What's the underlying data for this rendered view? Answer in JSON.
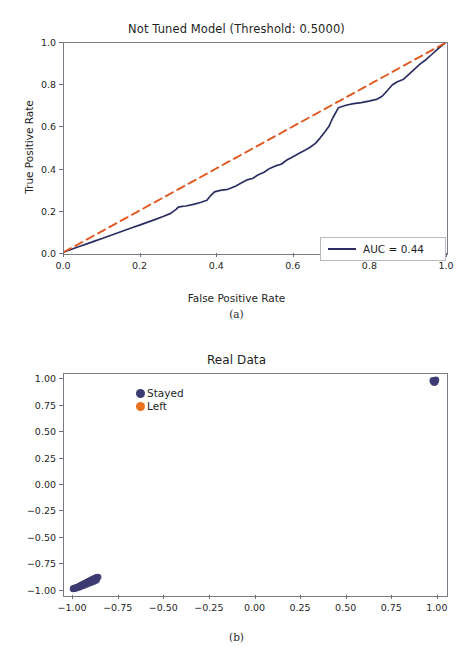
{
  "figure_a": {
    "caption": "(a)",
    "chart_data": {
      "type": "line",
      "title": "Not Tuned Model (Threshold: 0.5000)",
      "xlabel": "False Positive Rate",
      "ylabel": "True Positive Rate",
      "xlim": [
        0.0,
        1.0
      ],
      "ylim": [
        0.0,
        1.0
      ],
      "xticks": [
        "0.0",
        "0.2",
        "0.4",
        "0.6",
        "0.8",
        "1.0"
      ],
      "xtick_values": [
        0.0,
        0.2,
        0.4,
        0.6,
        0.8,
        1.0
      ],
      "yticks": [
        "0.0",
        "0.2",
        "0.4",
        "0.6",
        "0.8",
        "1.0"
      ],
      "ytick_values": [
        0.0,
        0.2,
        0.4,
        0.6,
        0.8,
        1.0
      ],
      "grid": false,
      "legend_position": "lower right",
      "series": [
        {
          "name": "AUC = 0.44",
          "color": "#2c2e63",
          "style": "solid",
          "x": [
            0.0,
            0.02,
            0.04,
            0.06,
            0.08,
            0.1,
            0.12,
            0.14,
            0.16,
            0.18,
            0.2,
            0.22,
            0.24,
            0.26,
            0.28,
            0.295,
            0.3,
            0.31,
            0.32,
            0.34,
            0.36,
            0.375,
            0.385,
            0.395,
            0.41,
            0.43,
            0.45,
            0.465,
            0.48,
            0.495,
            0.51,
            0.525,
            0.54,
            0.555,
            0.57,
            0.585,
            0.6,
            0.615,
            0.63,
            0.645,
            0.66,
            0.672,
            0.685,
            0.695,
            0.705,
            0.72,
            0.74,
            0.76,
            0.78,
            0.8,
            0.82,
            0.835,
            0.85,
            0.862,
            0.875,
            0.89,
            0.905,
            0.92,
            0.935,
            0.95,
            0.965,
            0.98,
            0.99,
            1.0
          ],
          "y": [
            0.0,
            0.013,
            0.026,
            0.039,
            0.052,
            0.065,
            0.078,
            0.091,
            0.104,
            0.117,
            0.13,
            0.143,
            0.156,
            0.17,
            0.185,
            0.205,
            0.215,
            0.218,
            0.22,
            0.228,
            0.238,
            0.248,
            0.27,
            0.288,
            0.295,
            0.3,
            0.315,
            0.33,
            0.345,
            0.352,
            0.37,
            0.382,
            0.4,
            0.412,
            0.42,
            0.44,
            0.455,
            0.47,
            0.485,
            0.5,
            0.52,
            0.545,
            0.575,
            0.6,
            0.64,
            0.69,
            0.702,
            0.71,
            0.715,
            0.722,
            0.73,
            0.745,
            0.775,
            0.8,
            0.815,
            0.825,
            0.85,
            0.875,
            0.9,
            0.92,
            0.945,
            0.97,
            0.985,
            1.0
          ]
        },
        {
          "name": "chance",
          "color": "#e2561f",
          "style": "dashed",
          "x": [
            0.0,
            1.0
          ],
          "y": [
            0.0,
            1.0
          ]
        }
      ],
      "annotations": []
    },
    "legend": {
      "auc_label": "AUC = 0.44",
      "line_color": "#2c2e63"
    }
  },
  "figure_b": {
    "caption": "(b)",
    "chart_data": {
      "type": "scatter",
      "title": "Real Data",
      "xlabel": "",
      "ylabel": "",
      "xlim": [
        -1.05,
        1.05
      ],
      "ylim": [
        -1.05,
        1.05
      ],
      "xticks": [
        "-1.00",
        "-0.75",
        "-0.50",
        "-0.25",
        "0.00",
        "0.25",
        "0.50",
        "0.75",
        "1.00"
      ],
      "xtick_values": [
        -1.0,
        -0.75,
        -0.5,
        -0.25,
        0.0,
        0.25,
        0.5,
        0.75,
        1.0
      ],
      "yticks": [
        "1.00",
        "0.75",
        "0.50",
        "0.25",
        "0.00",
        "-0.25",
        "-0.50",
        "-0.75",
        "-1.00"
      ],
      "ytick_values": [
        1.0,
        0.75,
        0.5,
        0.25,
        0.0,
        -0.25,
        -0.5,
        -0.75,
        -1.0
      ],
      "grid": false,
      "legend_position": "upper left",
      "series": [
        {
          "name": "Stayed",
          "color": "#3c3c72",
          "marker": "o",
          "points": [
            [
              -1.0,
              -1.0
            ],
            [
              -0.995,
              -0.997
            ],
            [
              -0.99,
              -0.993
            ],
            [
              -0.985,
              -0.99
            ],
            [
              -0.98,
              -0.986
            ],
            [
              -0.975,
              -0.983
            ],
            [
              -0.97,
              -0.979
            ],
            [
              -0.965,
              -0.976
            ],
            [
              -0.962,
              -0.972
            ],
            [
              -0.958,
              -0.969
            ],
            [
              -0.954,
              -0.965
            ],
            [
              -0.95,
              -0.962
            ],
            [
              -0.946,
              -0.958
            ],
            [
              -0.942,
              -0.955
            ],
            [
              -0.938,
              -0.951
            ],
            [
              -0.934,
              -0.948
            ],
            [
              -0.93,
              -0.944
            ],
            [
              -0.926,
              -0.941
            ],
            [
              -0.922,
              -0.937
            ],
            [
              -0.918,
              -0.934
            ],
            [
              -0.914,
              -0.93
            ],
            [
              -0.91,
              -0.927
            ],
            [
              -0.906,
              -0.923
            ],
            [
              -0.902,
              -0.92
            ],
            [
              -0.898,
              -0.916
            ],
            [
              -0.894,
              -0.913
            ],
            [
              -0.89,
              -0.909
            ],
            [
              -0.886,
              -0.906
            ],
            [
              -0.882,
              -0.902
            ],
            [
              -0.878,
              -0.899
            ],
            [
              -0.874,
              -0.895
            ],
            [
              -0.87,
              -0.892
            ],
            [
              -0.866,
              -0.89
            ],
            [
              -0.862,
              -0.888
            ],
            [
              -0.99,
              -0.998
            ],
            [
              -0.978,
              -0.992
            ],
            [
              -0.966,
              -0.985
            ],
            [
              -0.955,
              -0.978
            ],
            [
              -0.944,
              -0.97
            ],
            [
              -0.933,
              -0.962
            ],
            [
              -0.922,
              -0.955
            ],
            [
              -0.911,
              -0.947
            ],
            [
              -0.9,
              -0.94
            ],
            [
              -0.889,
              -0.932
            ],
            [
              -0.878,
              -0.924
            ],
            [
              -0.87,
              -0.916
            ],
            [
              -0.998,
              -0.999
            ],
            [
              -0.994,
              -0.996
            ],
            [
              0.985,
              0.98
            ],
            [
              0.99,
              0.985
            ],
            [
              0.995,
              0.99
            ],
            [
              1.0,
              0.995
            ],
            [
              0.988,
              0.972
            ],
            [
              0.993,
              0.968
            ],
            [
              0.997,
              0.978
            ],
            [
              0.983,
              0.988
            ]
          ]
        },
        {
          "name": "Left",
          "color": "#e8721f",
          "marker": "o",
          "points": []
        }
      ]
    },
    "legend": {
      "items": [
        {
          "label": "Stayed",
          "color": "#3c3c72"
        },
        {
          "label": "Left",
          "color": "#e8721f"
        }
      ]
    }
  }
}
